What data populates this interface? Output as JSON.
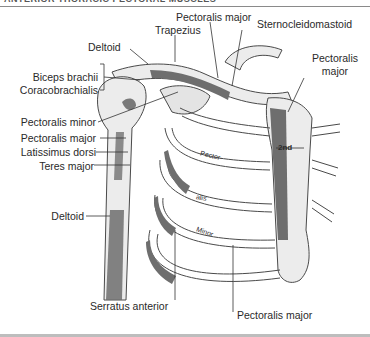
{
  "figure": {
    "header_title": "ANTERIOR THORACIC PECTORAL MUSCLES",
    "rib_marker": "2nd",
    "rib_texts": [
      "Pector-",
      "alis",
      "Minor"
    ],
    "colors": {
      "bone": "#ececec",
      "bone_outline": "#4a4a4a",
      "muscle_attachment": "#6e6e6e",
      "label_text": "#2a2a2a"
    }
  },
  "labels": {
    "left": {
      "deltoid_top": "Deltoid",
      "biceps_brachii": "Biceps brachii",
      "coracobrachialis": "Coracobrachialis",
      "pectoralis_minor": "Pectoralis minor",
      "pectoralis_major": "Pectoralis major",
      "latissimus_dorsi": "Latissimus dorsi",
      "teres_major": "Teres major",
      "deltoid_bottom": "Deltoid"
    },
    "top": {
      "trapezius": "Trapezius",
      "pectoralis_major": "Pectoralis major",
      "sternocleidomastoid": "Sternocleidomastoid"
    },
    "right": {
      "pectoralis_major_line1": "Pectoralis",
      "pectoralis_major_line2": "major"
    },
    "bottom": {
      "serratus_anterior": "Serratus anterior",
      "pectoralis_major": "Pectoralis major"
    }
  }
}
